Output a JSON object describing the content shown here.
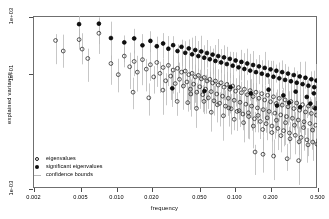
{
  "chart_data": {
    "type": "scatter",
    "title": "",
    "xlabel": "frequency",
    "ylabel": "explained variance",
    "xscale": "log",
    "yscale": "log",
    "grid": false,
    "xlim": [
      0.002,
      0.5
    ],
    "ylim": [
      0.001,
      1000
    ],
    "xticks": [
      0.002,
      0.005,
      0.01,
      0.02,
      0.05,
      0.1,
      0.2,
      0.5
    ],
    "xticklabels": [
      "0.002",
      "0.005",
      "0.010",
      "0.020",
      "0.050",
      "0.100",
      "0.200",
      "0.500"
    ],
    "yticks": [
      1000,
      10,
      0.001
    ],
    "yticklabels": [
      "1e+03",
      "1e+01",
      "1e-03"
    ],
    "legend_position": "bottom-left",
    "legend": [
      {
        "label": "eigenvalues",
        "marker": "open-circle",
        "color": "#1a1a1a"
      },
      {
        "label": "significant eigenvalues",
        "marker": "filled-circle",
        "color": "#0d0d0d"
      },
      {
        "label": "confidence bounds",
        "marker": "vertical-line",
        "color": "#b9b9b9"
      }
    ],
    "series": [
      {
        "name": "eigenvalues",
        "marker": "open-circle",
        "points": [
          [
            0.0031,
            140
          ],
          [
            0.0036,
            60
          ],
          [
            0.0049,
            150
          ],
          [
            0.0052,
            70
          ],
          [
            0.0058,
            33
          ],
          [
            0.0072,
            250
          ],
          [
            0.0091,
            22
          ],
          [
            0.0105,
            9
          ],
          [
            0.0118,
            40
          ],
          [
            0.0131,
            17
          ],
          [
            0.0143,
            26
          ],
          [
            0.0152,
            11
          ],
          [
            0.0168,
            30
          ],
          [
            0.0181,
            14
          ],
          [
            0.0196,
            20
          ],
          [
            0.0209,
            7.5
          ],
          [
            0.0222,
            24
          ],
          [
            0.0236,
            10
          ],
          [
            0.0251,
            16
          ],
          [
            0.0264,
            5.5
          ],
          [
            0.0278,
            19
          ],
          [
            0.0291,
            8
          ],
          [
            0.0305,
            13
          ],
          [
            0.0318,
            4.4
          ],
          [
            0.0332,
            15
          ],
          [
            0.0345,
            6.2
          ],
          [
            0.0359,
            11
          ],
          [
            0.0372,
            3.6
          ],
          [
            0.0386,
            12
          ],
          [
            0.0399,
            5.0
          ],
          [
            0.0413,
            9
          ],
          [
            0.0427,
            2.8
          ],
          [
            0.0441,
            10
          ],
          [
            0.0455,
            4.2
          ],
          [
            0.0469,
            7.5
          ],
          [
            0.0483,
            2.2
          ],
          [
            0.0498,
            8.5
          ],
          [
            0.0512,
            3.4
          ],
          [
            0.0527,
            6.4
          ],
          [
            0.0542,
            1.8
          ],
          [
            0.0558,
            7.2
          ],
          [
            0.0573,
            2.8
          ],
          [
            0.0589,
            5.4
          ],
          [
            0.0605,
            1.4
          ],
          [
            0.0622,
            6.2
          ],
          [
            0.0639,
            2.3
          ],
          [
            0.0657,
            4.6
          ],
          [
            0.0675,
            1.1
          ],
          [
            0.0694,
            5.4
          ],
          [
            0.0713,
            1.9
          ],
          [
            0.0733,
            3.9
          ],
          [
            0.0754,
            0.9
          ],
          [
            0.0775,
            4.7
          ],
          [
            0.0797,
            1.6
          ],
          [
            0.082,
            3.3
          ],
          [
            0.0843,
            0.72
          ],
          [
            0.0867,
            4.1
          ],
          [
            0.0892,
            1.35
          ],
          [
            0.0918,
            2.8
          ],
          [
            0.0944,
            0.58
          ],
          [
            0.0971,
            3.6
          ],
          [
            0.0999,
            1.15
          ],
          [
            0.1028,
            2.4
          ],
          [
            0.1057,
            0.47
          ],
          [
            0.1088,
            3.2
          ],
          [
            0.1119,
            0.98
          ],
          [
            0.1151,
            2.1
          ],
          [
            0.1184,
            0.38
          ],
          [
            0.1218,
            2.8
          ],
          [
            0.1253,
            0.84
          ],
          [
            0.1289,
            1.8
          ],
          [
            0.1326,
            0.31
          ],
          [
            0.1364,
            2.5
          ],
          [
            0.1403,
            0.72
          ],
          [
            0.1443,
            1.55
          ],
          [
            0.1484,
            0.26
          ],
          [
            0.1527,
            2.2
          ],
          [
            0.1571,
            0.62
          ],
          [
            0.1616,
            1.35
          ],
          [
            0.1662,
            0.21
          ],
          [
            0.171,
            1.95
          ],
          [
            0.1759,
            0.54
          ],
          [
            0.1809,
            1.18
          ],
          [
            0.1861,
            0.175
          ],
          [
            0.1915,
            1.72
          ],
          [
            0.197,
            0.47
          ],
          [
            0.2026,
            1.02
          ],
          [
            0.2084,
            0.145
          ],
          [
            0.2144,
            1.52
          ],
          [
            0.2205,
            0.41
          ],
          [
            0.2269,
            0.89
          ],
          [
            0.2334,
            0.12
          ],
          [
            0.2401,
            1.34
          ],
          [
            0.247,
            0.355
          ],
          [
            0.2541,
            0.78
          ],
          [
            0.2614,
            0.1
          ],
          [
            0.2689,
            1.18
          ],
          [
            0.2766,
            0.31
          ],
          [
            0.2846,
            0.68
          ],
          [
            0.2928,
            0.083
          ],
          [
            0.3012,
            1.04
          ],
          [
            0.3098,
            0.27
          ],
          [
            0.3187,
            0.59
          ],
          [
            0.3279,
            0.069
          ],
          [
            0.3373,
            0.92
          ],
          [
            0.347,
            0.235
          ],
          [
            0.357,
            0.52
          ],
          [
            0.3672,
            0.058
          ],
          [
            0.3778,
            0.81
          ],
          [
            0.3886,
            0.205
          ],
          [
            0.3998,
            0.45
          ],
          [
            0.4113,
            0.048
          ],
          [
            0.4231,
            0.72
          ],
          [
            0.4353,
            0.178
          ],
          [
            0.4478,
            0.4
          ],
          [
            0.4607,
            0.04
          ],
          [
            0.4739,
            0.63
          ],
          [
            0.4875,
            0.155
          ],
          [
            0.495,
            0.35
          ],
          [
            0.499,
            0.034
          ],
          [
            0.0405,
            0.95
          ],
          [
            0.048,
            0.6
          ],
          [
            0.0555,
            1.05
          ],
          [
            0.064,
            0.44
          ],
          [
            0.072,
            0.8
          ],
          [
            0.081,
            0.33
          ],
          [
            0.09,
            0.62
          ],
          [
            0.1,
            0.25
          ],
          [
            0.11,
            0.5
          ],
          [
            0.12,
            0.19
          ],
          [
            0.132,
            0.42
          ],
          [
            0.145,
            0.145
          ],
          [
            0.159,
            0.34
          ],
          [
            0.174,
            0.11
          ],
          [
            0.19,
            0.28
          ],
          [
            0.208,
            0.086
          ],
          [
            0.227,
            0.23
          ],
          [
            0.248,
            0.067
          ],
          [
            0.271,
            0.19
          ],
          [
            0.296,
            0.052
          ],
          [
            0.323,
            0.155
          ],
          [
            0.353,
            0.041
          ],
          [
            0.385,
            0.128
          ],
          [
            0.42,
            0.032
          ],
          [
            0.458,
            0.105
          ],
          [
            0.014,
            2.2
          ],
          [
            0.019,
            1.4
          ],
          [
            0.025,
            2.6
          ],
          [
            0.033,
            1.05
          ],
          [
            0.043,
            1.9
          ],
          [
            0.215,
            0.013
          ],
          [
            0.28,
            0.0105
          ],
          [
            0.35,
            0.009
          ],
          [
            0.15,
            0.018
          ],
          [
            0.175,
            0.015
          ]
        ]
      },
      {
        "name": "significant eigenvalues",
        "marker": "filled-circle",
        "points": [
          [
            0.0049,
            520
          ],
          [
            0.0072,
            540
          ],
          [
            0.0091,
            170
          ],
          [
            0.0118,
            120
          ],
          [
            0.0143,
            165
          ],
          [
            0.0168,
            95
          ],
          [
            0.0196,
            135
          ],
          [
            0.0222,
            88
          ],
          [
            0.0251,
            110
          ],
          [
            0.0278,
            72
          ],
          [
            0.0305,
            96
          ],
          [
            0.0332,
            60
          ],
          [
            0.0359,
            84
          ],
          [
            0.0386,
            52
          ],
          [
            0.0413,
            74
          ],
          [
            0.0441,
            46
          ],
          [
            0.0469,
            65
          ],
          [
            0.0498,
            40
          ],
          [
            0.0527,
            58
          ],
          [
            0.0558,
            35
          ],
          [
            0.0589,
            51
          ],
          [
            0.0622,
            31
          ],
          [
            0.0657,
            45
          ],
          [
            0.0694,
            27
          ],
          [
            0.0733,
            40
          ],
          [
            0.0775,
            24
          ],
          [
            0.082,
            36
          ],
          [
            0.0867,
            21
          ],
          [
            0.0918,
            32
          ],
          [
            0.0971,
            18.5
          ],
          [
            0.1028,
            28
          ],
          [
            0.1088,
            16.2
          ],
          [
            0.1151,
            25
          ],
          [
            0.1218,
            14.2
          ],
          [
            0.1289,
            22
          ],
          [
            0.1364,
            12.5
          ],
          [
            0.1443,
            19.5
          ],
          [
            0.1527,
            11
          ],
          [
            0.1616,
            17.5
          ],
          [
            0.171,
            9.7
          ],
          [
            0.1809,
            15.5
          ],
          [
            0.1915,
            8.6
          ],
          [
            0.2026,
            13.8
          ],
          [
            0.2144,
            7.6
          ],
          [
            0.2269,
            12.3
          ],
          [
            0.2401,
            6.7
          ],
          [
            0.2541,
            11
          ],
          [
            0.2689,
            5.9
          ],
          [
            0.2846,
            9.8
          ],
          [
            0.3012,
            5.3
          ],
          [
            0.3187,
            8.7
          ],
          [
            0.3373,
            4.7
          ],
          [
            0.357,
            7.8
          ],
          [
            0.3778,
            4.2
          ],
          [
            0.3998,
            7.0
          ],
          [
            0.4231,
            3.7
          ],
          [
            0.4478,
            6.2
          ],
          [
            0.4739,
            3.3
          ],
          [
            0.495,
            5.6
          ],
          [
            0.03,
            3.0
          ],
          [
            0.056,
            2.4
          ],
          [
            0.093,
            3.3
          ],
          [
            0.138,
            2.0
          ],
          [
            0.195,
            2.7
          ],
          [
            0.26,
            1.7
          ],
          [
            0.33,
            2.3
          ],
          [
            0.41,
            1.5
          ],
          [
            0.47,
            2.0
          ],
          [
            0.23,
            0.75
          ],
          [
            0.29,
            0.95
          ],
          [
            0.36,
            0.66
          ],
          [
            0.44,
            0.88
          ],
          [
            0.485,
            0.6
          ]
        ]
      }
    ],
    "confidence_bounds": {
      "name": "confidence bounds",
      "style": "vertical-line",
      "color": "#b9b9b9",
      "description": "vertical whiskers spanning lower to upper confidence limit at each frequency"
    }
  }
}
